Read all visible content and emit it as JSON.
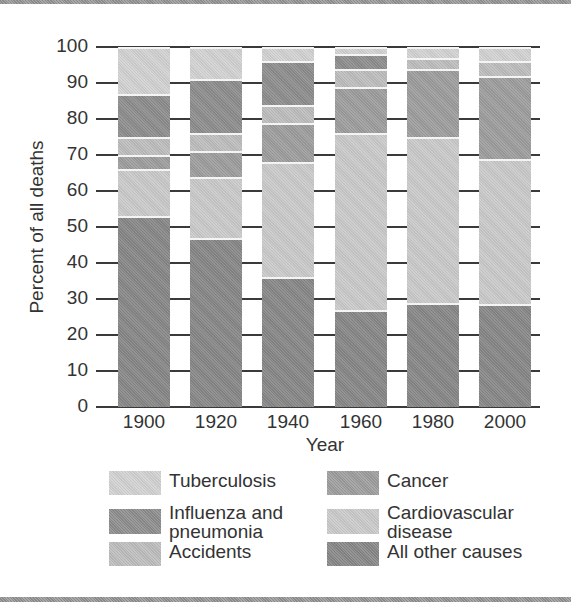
{
  "chart_data": {
    "type": "bar",
    "stacked": true,
    "title": "",
    "xlabel": "Year",
    "ylabel": "Percent of all deaths",
    "ylim": [
      0,
      100
    ],
    "yticks": [
      "0",
      "10",
      "20",
      "30",
      "40",
      "50",
      "60",
      "70",
      "80",
      "90",
      "100"
    ],
    "grid": true,
    "legend_position": "bottom",
    "categories": [
      "1900",
      "1920",
      "1940",
      "1960",
      "1980",
      "2000"
    ],
    "series": [
      {
        "name": "All other causes",
        "color": "#878787",
        "values": [
          53,
          47,
          36,
          27,
          29,
          28.5
        ]
      },
      {
        "name": "Cardiovascular disease",
        "color": "#cacaca",
        "values": [
          13,
          17,
          32,
          49,
          46,
          40.5
        ]
      },
      {
        "name": "Cancer",
        "color": "#9d9d9d",
        "values": [
          4,
          7,
          11,
          13,
          19,
          23
        ]
      },
      {
        "name": "Accidents",
        "color": "#bdbdbd",
        "values": [
          5,
          5,
          5,
          5,
          3,
          4
        ]
      },
      {
        "name": "Influenza and pneumonia",
        "color": "#8d8d8d",
        "values": [
          12,
          15,
          12,
          4,
          0,
          0
        ]
      },
      {
        "name": "Tuberculosis",
        "color": "#d2d2d2",
        "values": [
          13,
          9,
          4,
          2,
          3,
          4
        ]
      }
    ]
  },
  "legend": [
    {
      "label": "Tuberculosis",
      "color": "#d2d2d2"
    },
    {
      "label": "Influenza and pneumonia",
      "color": "#8d8d8d"
    },
    {
      "label": "Accidents",
      "color": "#bdbdbd"
    },
    {
      "label": "Cancer",
      "color": "#9d9d9d"
    },
    {
      "label": "Cardiovascular disease",
      "color": "#cacaca"
    },
    {
      "label": "All other causes",
      "color": "#878787"
    }
  ]
}
